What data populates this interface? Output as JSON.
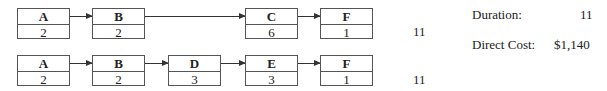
{
  "paths": [
    {
      "nodes": [
        {
          "name": "A",
          "duration": "2"
        },
        {
          "name": "B",
          "duration": "2"
        },
        {
          "name": "C",
          "duration": "6"
        },
        {
          "name": "F",
          "duration": "1"
        }
      ],
      "total": "11"
    },
    {
      "nodes": [
        {
          "name": "A",
          "duration": "2"
        },
        {
          "name": "B",
          "duration": "2"
        },
        {
          "name": "D",
          "duration": "3"
        },
        {
          "name": "E",
          "duration": "3"
        },
        {
          "name": "F",
          "duration": "1"
        }
      ],
      "total": "11"
    }
  ],
  "summary": {
    "duration_label": "Duration:",
    "duration_value": "11",
    "cost_label": "Direct Cost:",
    "cost_value": "$1,140"
  }
}
